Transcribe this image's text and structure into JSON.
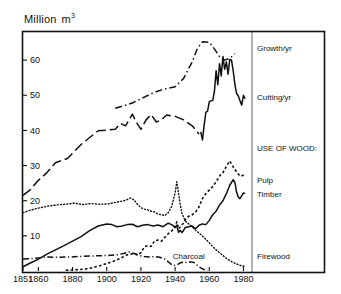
{
  "chart_data": {
    "type": "line",
    "title": "",
    "subtitle": "",
    "unit_label_prefix": "Million",
    "unit_label_base": "m",
    "unit_label_exponent": "3",
    "ylabel": "Million m3",
    "xlabel": "",
    "xlim": [
      1851,
      1985
    ],
    "ylim": [
      0,
      68
    ],
    "grid": false,
    "legend_position": "right",
    "xticks": [
      1851,
      1860,
      1880,
      1900,
      1920,
      1940,
      1960,
      1980
    ],
    "xtick_labels": [
      "1851",
      "1860",
      "1880",
      "1900",
      "1920",
      "1940",
      "1960",
      "1980"
    ],
    "yticks": [
      10,
      20,
      30,
      40,
      50,
      60
    ],
    "ytick_labels": [
      "10",
      "20",
      "30",
      "40",
      "50",
      "60"
    ],
    "annotations": [
      {
        "text": "Charcoal",
        "x": 1948,
        "y": 3.4
      },
      {
        "text": "USE OF WOOD:",
        "x": 1987,
        "y": 35.0
      }
    ],
    "legend_entries": [
      {
        "name": "growth",
        "label": "Growth/yr",
        "style": "dash-dot",
        "y": 63.5
      },
      {
        "name": "cutting",
        "label": "Cutting/yr",
        "style": "solid",
        "y": 49.5
      },
      {
        "name": "use-of-wood-header",
        "label": "USE OF WOOD:",
        "style": "none",
        "y": 35.0
      },
      {
        "name": "pulp",
        "label": "Pulp",
        "style": "dotted",
        "y": 25.8
      },
      {
        "name": "timber",
        "label": "Timber",
        "style": "solid",
        "y": 21.8
      },
      {
        "name": "firewood",
        "label": "Firewood",
        "style": "fine-dotted",
        "y": 4.2
      }
    ],
    "series": [
      {
        "name": "growth",
        "label": "Growth/yr",
        "style": "dash-dot",
        "points": [
          [
            1905,
            46.3
          ],
          [
            1910,
            47.0
          ],
          [
            1915,
            47.8
          ],
          [
            1920,
            49.0
          ],
          [
            1925,
            50.2
          ],
          [
            1930,
            51.2
          ],
          [
            1935,
            51.9
          ],
          [
            1940,
            52.4
          ],
          [
            1945,
            54.8
          ],
          [
            1950,
            59.5
          ],
          [
            1953,
            63.3
          ],
          [
            1956,
            65.2
          ],
          [
            1960,
            65.1
          ],
          [
            1963,
            63.2
          ],
          [
            1966,
            61.0
          ],
          [
            1969,
            60.0
          ],
          [
            1972,
            60.5
          ],
          [
            1975,
            61.8
          ]
        ]
      },
      {
        "name": "cutting-early",
        "label": "Cutting/yr (historic, dashed)",
        "style": "long-dash",
        "points": [
          [
            1851,
            21.5
          ],
          [
            1855,
            23.0
          ],
          [
            1860,
            25.8
          ],
          [
            1865,
            28.0
          ],
          [
            1870,
            30.8
          ],
          [
            1877,
            32.0
          ],
          [
            1885,
            36.0
          ],
          [
            1895,
            39.9
          ],
          [
            1905,
            40.3
          ],
          [
            1908,
            42.0
          ],
          [
            1911,
            41.3
          ],
          [
            1915,
            44.6
          ],
          [
            1918,
            41.8
          ],
          [
            1920,
            40.3
          ],
          [
            1923,
            43.0
          ],
          [
            1926,
            44.5
          ],
          [
            1929,
            42.4
          ],
          [
            1932,
            43.0
          ],
          [
            1935,
            44.4
          ],
          [
            1940,
            44.0
          ],
          [
            1945,
            43.0
          ],
          [
            1950,
            41.3
          ],
          [
            1954,
            39.0
          ]
        ]
      },
      {
        "name": "cutting-late",
        "label": "Cutting/yr",
        "style": "solid",
        "points": [
          [
            1955,
            39.6
          ],
          [
            1956,
            37.3
          ],
          [
            1957,
            41.5
          ],
          [
            1958,
            45.2
          ],
          [
            1959,
            45.4
          ],
          [
            1960,
            48.2
          ],
          [
            1961,
            48.4
          ],
          [
            1962,
            48.5
          ],
          [
            1963,
            51.0
          ],
          [
            1964,
            57.0
          ],
          [
            1965,
            53.0
          ],
          [
            1966,
            59.0
          ],
          [
            1967,
            55.5
          ],
          [
            1968,
            61.0
          ],
          [
            1969,
            57.4
          ],
          [
            1970,
            59.5
          ],
          [
            1971,
            56.0
          ],
          [
            1972,
            60.2
          ],
          [
            1973,
            60.0
          ],
          [
            1974,
            57.0
          ],
          [
            1975,
            53.0
          ],
          [
            1976,
            50.5
          ],
          [
            1977,
            49.8
          ],
          [
            1978,
            48.4
          ],
          [
            1979,
            47.2
          ],
          [
            1980,
            50.0
          ],
          [
            1981,
            49.0
          ]
        ]
      },
      {
        "name": "pulp",
        "label": "Pulp",
        "style": "dotted",
        "points": [
          [
            1876,
            0.2
          ],
          [
            1880,
            0.3
          ],
          [
            1884,
            0.4
          ],
          [
            1888,
            0.6
          ],
          [
            1892,
            1.0
          ],
          [
            1896,
            1.5
          ],
          [
            1900,
            2.1
          ],
          [
            1904,
            2.8
          ],
          [
            1908,
            3.6
          ],
          [
            1912,
            4.6
          ],
          [
            1916,
            5.0
          ],
          [
            1918,
            4.6
          ],
          [
            1920,
            5.2
          ],
          [
            1922,
            6.9
          ],
          [
            1924,
            7.2
          ],
          [
            1926,
            7.0
          ],
          [
            1928,
            8.6
          ],
          [
            1930,
            8.8
          ],
          [
            1932,
            8.5
          ],
          [
            1934,
            9.6
          ],
          [
            1936,
            10.6
          ],
          [
            1938,
            11.4
          ],
          [
            1940,
            12.5
          ],
          [
            1941,
            14.0
          ],
          [
            1942,
            12.0
          ],
          [
            1944,
            13.0
          ],
          [
            1946,
            14.6
          ],
          [
            1948,
            15.6
          ],
          [
            1950,
            16.0
          ],
          [
            1952,
            16.8
          ],
          [
            1954,
            18.2
          ],
          [
            1956,
            20.6
          ],
          [
            1958,
            22.0
          ],
          [
            1960,
            23.0
          ],
          [
            1962,
            24.0
          ],
          [
            1964,
            25.4
          ],
          [
            1966,
            27.0
          ],
          [
            1968,
            28.0
          ],
          [
            1970,
            29.8
          ],
          [
            1972,
            31.3
          ],
          [
            1974,
            29.6
          ],
          [
            1976,
            28.2
          ],
          [
            1978,
            27.0
          ],
          [
            1980,
            27.2
          ],
          [
            1981,
            26.8
          ]
        ]
      },
      {
        "name": "timber",
        "label": "Timber",
        "style": "solid",
        "points": [
          [
            1851,
            1.2
          ],
          [
            1855,
            2.2
          ],
          [
            1860,
            3.4
          ],
          [
            1865,
            4.8
          ],
          [
            1870,
            6.0
          ],
          [
            1875,
            7.2
          ],
          [
            1880,
            8.5
          ],
          [
            1885,
            9.8
          ],
          [
            1890,
            11.5
          ],
          [
            1895,
            12.8
          ],
          [
            1900,
            13.4
          ],
          [
            1903,
            13.2
          ],
          [
            1906,
            12.6
          ],
          [
            1909,
            12.8
          ],
          [
            1912,
            13.2
          ],
          [
            1915,
            13.3
          ],
          [
            1918,
            12.6
          ],
          [
            1921,
            13.0
          ],
          [
            1924,
            13.2
          ],
          [
            1927,
            12.8
          ],
          [
            1930,
            13.1
          ],
          [
            1933,
            12.6
          ],
          [
            1936,
            13.6
          ],
          [
            1938,
            13.2
          ],
          [
            1940,
            12.4
          ],
          [
            1941,
            13.0
          ],
          [
            1942,
            11.0
          ],
          [
            1943,
            11.6
          ],
          [
            1944,
            10.9
          ],
          [
            1945,
            11.6
          ],
          [
            1946,
            12.4
          ],
          [
            1948,
            12.6
          ],
          [
            1950,
            12.8
          ],
          [
            1952,
            12.0
          ],
          [
            1954,
            13.0
          ],
          [
            1956,
            13.4
          ],
          [
            1958,
            13.2
          ],
          [
            1960,
            14.4
          ],
          [
            1962,
            16.0
          ],
          [
            1964,
            17.0
          ],
          [
            1966,
            18.8
          ],
          [
            1968,
            20.0
          ],
          [
            1970,
            22.0
          ],
          [
            1972,
            24.4
          ],
          [
            1974,
            26.0
          ],
          [
            1975,
            25.2
          ],
          [
            1976,
            22.4
          ],
          [
            1977,
            21.0
          ],
          [
            1978,
            20.6
          ],
          [
            1980,
            22.2
          ],
          [
            1981,
            22.0
          ]
        ]
      },
      {
        "name": "firewood",
        "label": "Firewood",
        "style": "fine-dotted",
        "points": [
          [
            1851,
            16.6
          ],
          [
            1856,
            17.4
          ],
          [
            1861,
            18.0
          ],
          [
            1866,
            18.5
          ],
          [
            1871,
            18.8
          ],
          [
            1876,
            19.0
          ],
          [
            1881,
            19.3
          ],
          [
            1886,
            18.9
          ],
          [
            1891,
            19.2
          ],
          [
            1896,
            19.0
          ],
          [
            1901,
            19.1
          ],
          [
            1906,
            19.6
          ],
          [
            1911,
            20.1
          ],
          [
            1914,
            20.8
          ],
          [
            1916,
            20.2
          ],
          [
            1918,
            19.0
          ],
          [
            1920,
            18.0
          ],
          [
            1922,
            17.6
          ],
          [
            1924,
            17.4
          ],
          [
            1926,
            17.0
          ],
          [
            1928,
            16.8
          ],
          [
            1930,
            16.2
          ],
          [
            1932,
            16.0
          ],
          [
            1934,
            15.8
          ],
          [
            1936,
            16.6
          ],
          [
            1938,
            18.4
          ],
          [
            1940,
            22.2
          ],
          [
            1941,
            25.4
          ],
          [
            1942,
            22.2
          ],
          [
            1943,
            19.0
          ],
          [
            1944,
            16.4
          ],
          [
            1946,
            14.2
          ],
          [
            1948,
            13.4
          ],
          [
            1950,
            12.6
          ],
          [
            1952,
            11.6
          ],
          [
            1954,
            10.8
          ],
          [
            1956,
            10.0
          ],
          [
            1958,
            9.0
          ],
          [
            1960,
            8.0
          ],
          [
            1962,
            7.0
          ],
          [
            1964,
            6.0
          ],
          [
            1966,
            5.2
          ],
          [
            1968,
            4.4
          ],
          [
            1970,
            3.6
          ],
          [
            1972,
            3.0
          ],
          [
            1974,
            2.4
          ],
          [
            1976,
            2.0
          ],
          [
            1978,
            1.6
          ],
          [
            1980,
            1.4
          ],
          [
            1981,
            1.3
          ]
        ]
      },
      {
        "name": "charcoal",
        "label": "Charcoal",
        "style": "dash-dot",
        "points": [
          [
            1851,
            3.4
          ],
          [
            1858,
            3.6
          ],
          [
            1865,
            4.0
          ],
          [
            1872,
            3.9
          ],
          [
            1879,
            4.0
          ],
          [
            1886,
            4.2
          ],
          [
            1893,
            4.3
          ],
          [
            1900,
            4.4
          ],
          [
            1906,
            4.6
          ],
          [
            1910,
            5.0
          ],
          [
            1913,
            5.4
          ],
          [
            1916,
            5.0
          ],
          [
            1919,
            4.4
          ],
          [
            1922,
            4.1
          ],
          [
            1925,
            4.0
          ],
          [
            1928,
            4.1
          ],
          [
            1931,
            3.9
          ],
          [
            1934,
            3.4
          ],
          [
            1937,
            2.2
          ],
          [
            1939,
            1.5
          ],
          [
            1941,
            1.7
          ],
          [
            1943,
            2.3
          ],
          [
            1945,
            2.6
          ],
          [
            1947,
            2.4
          ],
          [
            1949,
            2.6
          ],
          [
            1951,
            2.4
          ],
          [
            1953,
            1.6
          ],
          [
            1955,
            0.9
          ],
          [
            1957,
            0.4
          ],
          [
            1959,
            0.2
          ]
        ]
      }
    ]
  }
}
